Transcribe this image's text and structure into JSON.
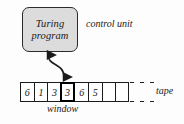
{
  "figure": {
    "colors": {
      "box_fill": "#dcdcdc",
      "stroke": "#1c1c1c",
      "background": "#fdfdfd",
      "window_stroke": "#000000"
    }
  },
  "control_unit": {
    "box_line1": "Turing",
    "box_line2": "program",
    "label": "control unit"
  },
  "arrow": {
    "name": "read-write-head-arrow",
    "style": "curved double-headed"
  },
  "tape": {
    "label": "tape",
    "window_label": "window",
    "window_index": 3,
    "cells": [
      {
        "value": "6",
        "highlighted": false
      },
      {
        "value": "1",
        "highlighted": false
      },
      {
        "value": "3",
        "highlighted": false
      },
      {
        "value": "3",
        "highlighted": true
      },
      {
        "value": "6",
        "highlighted": false
      },
      {
        "value": "5",
        "highlighted": false
      },
      {
        "value": "",
        "highlighted": false
      },
      {
        "value": "",
        "highlighted": false
      }
    ],
    "continuation": "dashes"
  }
}
